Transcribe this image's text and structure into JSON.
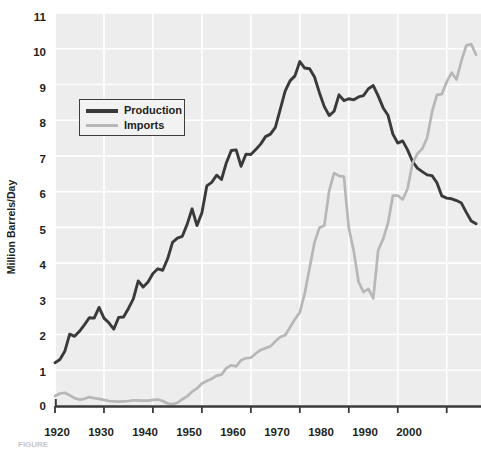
{
  "chart_data": {
    "type": "line",
    "title": "",
    "xlabel": "",
    "ylabel": "Million Barrels/Day",
    "xlim": [
      1920,
      2007
    ],
    "ylim": [
      0,
      11
    ],
    "xticks": [
      1920,
      1930,
      1940,
      1950,
      1960,
      1970,
      1980,
      1990,
      2000
    ],
    "yticks": [
      0,
      1,
      2,
      3,
      4,
      5,
      6,
      7,
      8,
      9,
      10,
      11
    ],
    "grid": true,
    "legend_position": "upper-left-inside",
    "colors": {
      "production": "#3a3a3a",
      "imports": "#b7b7b7",
      "plot_background": "#ededed",
      "gridlines": "#ffffff",
      "axis": "#3a3a3a",
      "text": "#231f20"
    },
    "series": [
      {
        "name": "Production",
        "color": "#3a3a3a",
        "x": [
          1920,
          1921,
          1922,
          1923,
          1924,
          1925,
          1926,
          1927,
          1928,
          1929,
          1930,
          1931,
          1932,
          1933,
          1934,
          1935,
          1936,
          1937,
          1938,
          1939,
          1940,
          1941,
          1942,
          1943,
          1944,
          1945,
          1946,
          1947,
          1948,
          1949,
          1950,
          1951,
          1952,
          1953,
          1954,
          1955,
          1956,
          1957,
          1958,
          1959,
          1960,
          1961,
          1962,
          1963,
          1964,
          1965,
          1966,
          1967,
          1968,
          1969,
          1970,
          1971,
          1972,
          1973,
          1974,
          1975,
          1976,
          1977,
          1978,
          1979,
          1980,
          1981,
          1982,
          1983,
          1984,
          1985,
          1986,
          1987,
          1988,
          1989,
          1990,
          1991,
          1992,
          1993,
          1994,
          1995,
          1996,
          1997,
          1998,
          1999,
          2000,
          2001,
          2002,
          2003,
          2004,
          2005,
          2006
        ],
        "values": [
          1.21,
          1.3,
          1.53,
          2.01,
          1.95,
          2.09,
          2.27,
          2.47,
          2.46,
          2.76,
          2.46,
          2.33,
          2.15,
          2.48,
          2.49,
          2.73,
          3.0,
          3.5,
          3.33,
          3.47,
          3.71,
          3.84,
          3.8,
          4.12,
          4.58,
          4.7,
          4.75,
          5.09,
          5.52,
          5.05,
          5.41,
          6.16,
          6.26,
          6.46,
          6.34,
          6.81,
          7.15,
          7.17,
          6.71,
          7.05,
          7.04,
          7.18,
          7.33,
          7.54,
          7.61,
          7.8,
          8.3,
          8.81,
          9.1,
          9.24,
          9.64,
          9.46,
          9.44,
          9.21,
          8.77,
          8.38,
          8.13,
          8.25,
          8.71,
          8.55,
          8.6,
          8.57,
          8.65,
          8.69,
          8.88,
          8.97,
          8.68,
          8.35,
          8.14,
          7.61,
          7.36,
          7.42,
          7.17,
          6.85,
          6.66,
          6.56,
          6.47,
          6.45,
          6.25,
          5.88,
          5.82,
          5.8,
          5.75,
          5.68,
          5.42,
          5.18,
          5.1
        ]
      },
      {
        "name": "Imports",
        "color": "#b7b7b7",
        "x": [
          1920,
          1921,
          1922,
          1923,
          1924,
          1925,
          1926,
          1927,
          1928,
          1929,
          1930,
          1931,
          1932,
          1933,
          1934,
          1935,
          1936,
          1937,
          1938,
          1939,
          1940,
          1941,
          1942,
          1943,
          1944,
          1945,
          1946,
          1947,
          1948,
          1949,
          1950,
          1951,
          1952,
          1953,
          1954,
          1955,
          1956,
          1957,
          1958,
          1959,
          1960,
          1961,
          1962,
          1963,
          1964,
          1965,
          1966,
          1967,
          1968,
          1969,
          1970,
          1971,
          1972,
          1973,
          1974,
          1975,
          1976,
          1977,
          1978,
          1979,
          1980,
          1981,
          1982,
          1983,
          1984,
          1985,
          1986,
          1987,
          1988,
          1989,
          1990,
          1991,
          1992,
          1993,
          1994,
          1995,
          1996,
          1997,
          1998,
          1999,
          2000,
          2001,
          2002,
          2003,
          2004,
          2005,
          2006
        ],
        "values": [
          0.28,
          0.35,
          0.37,
          0.3,
          0.22,
          0.18,
          0.2,
          0.25,
          0.22,
          0.2,
          0.17,
          0.14,
          0.13,
          0.12,
          0.13,
          0.14,
          0.16,
          0.16,
          0.15,
          0.15,
          0.17,
          0.18,
          0.14,
          0.07,
          0.05,
          0.09,
          0.19,
          0.27,
          0.4,
          0.49,
          0.63,
          0.7,
          0.76,
          0.85,
          0.88,
          1.06,
          1.14,
          1.11,
          1.28,
          1.34,
          1.35,
          1.47,
          1.57,
          1.62,
          1.67,
          1.81,
          1.93,
          1.98,
          2.2,
          2.43,
          2.62,
          3.15,
          3.87,
          4.58,
          4.99,
          5.05,
          6.03,
          6.52,
          6.44,
          6.42,
          4.98,
          4.35,
          3.47,
          3.19,
          3.28,
          3.01,
          4.36,
          4.67,
          5.11,
          5.89,
          5.89,
          5.78,
          6.08,
          6.79,
          7.06,
          7.2,
          7.51,
          8.23,
          8.71,
          8.73,
          9.07,
          9.33,
          9.14,
          9.66,
          10.09,
          10.13,
          9.83
        ]
      }
    ]
  },
  "legend": {
    "items": [
      {
        "label": "Production",
        "swatch": "line-thick-dark"
      },
      {
        "label": "Imports",
        "swatch": "line-thin-gray"
      }
    ]
  },
  "axes": {
    "y_label": "Million Barrels/Day",
    "y_ticks": [
      "11",
      "10",
      "9",
      "8",
      "7",
      "6",
      "5",
      "4",
      "3",
      "2",
      "1",
      "0"
    ],
    "x_ticks": [
      "1920",
      "1930",
      "1940",
      "1950",
      "1960",
      "1970",
      "1980",
      "1990",
      "2000"
    ]
  },
  "caption": {
    "text": "FIGURE"
  }
}
